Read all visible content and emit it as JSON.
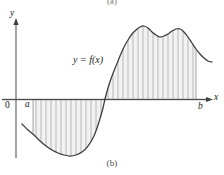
{
  "figure": {
    "panel_top_caption": "(a)",
    "panel_bottom_caption": "(b)",
    "curve_label": "y = f(x)",
    "axis": {
      "y_label": "y",
      "x_label": "x",
      "origin_label": "0",
      "lower_limit_label": "a",
      "upper_limit_label": "b"
    },
    "colors": {
      "curve": "#3b3b3b",
      "axis": "#4a4a4a",
      "hatch": "#9a9a9a",
      "fill": "#f2f2f2",
      "text": "#1a1a1a",
      "caption": "#4a4a4a"
    }
  },
  "chart_data": {
    "type": "area",
    "title": "",
    "xlabel": "x",
    "ylabel": "y",
    "grid": false,
    "legend": "none",
    "annotations": [
      {
        "text": "y = f(x)",
        "x": 0.38,
        "y": 0.62
      },
      {
        "text": "a",
        "x": 0.105,
        "y": 0.0
      },
      {
        "text": "b",
        "x": 0.905,
        "y": 0.0
      },
      {
        "text": "0",
        "x": 0.0,
        "y": 0.0
      }
    ],
    "series": [
      {
        "name": "f(x)",
        "comment": "Curve sampled in pixel space: x left-to-right, y with axis (y=0) at pixel 99.5",
        "points_px": [
          [
            22,
            124
          ],
          [
            28,
            130
          ],
          [
            34,
            135
          ],
          [
            40,
            141
          ],
          [
            46,
            146
          ],
          [
            52,
            150
          ],
          [
            58,
            153
          ],
          [
            64,
            155
          ],
          [
            70,
            156
          ],
          [
            76,
            155
          ],
          [
            82,
            152
          ],
          [
            88,
            146
          ],
          [
            94,
            136
          ],
          [
            99,
            122
          ],
          [
            103,
            108
          ],
          [
            105,
            99
          ],
          [
            108,
            88
          ],
          [
            112,
            76
          ],
          [
            116,
            66
          ],
          [
            120,
            56
          ],
          [
            124,
            47
          ],
          [
            128,
            40
          ],
          [
            132,
            34
          ],
          [
            136,
            30
          ],
          [
            140,
            27
          ],
          [
            144,
            26
          ],
          [
            148,
            28
          ],
          [
            152,
            32
          ],
          [
            156,
            35
          ],
          [
            160,
            37
          ],
          [
            164,
            36
          ],
          [
            168,
            34
          ],
          [
            172,
            31
          ],
          [
            176,
            29
          ],
          [
            180,
            29
          ],
          [
            184,
            32
          ],
          [
            188,
            37
          ],
          [
            192,
            43
          ],
          [
            196,
            49
          ],
          [
            200,
            54
          ],
          [
            204,
            58
          ],
          [
            208,
            61
          ],
          [
            212,
            62
          ]
        ],
        "zero_crossings_px": [
          105
        ],
        "extrema_px": [
          {
            "kind": "minimum",
            "x": 70,
            "y": 156
          },
          {
            "kind": "maximum",
            "x": 144,
            "y": 26
          },
          {
            "kind": "local-minimum",
            "x": 160,
            "y": 37
          },
          {
            "kind": "maximum",
            "x": 180,
            "y": 29
          }
        ]
      }
    ],
    "shaded_region": {
      "from_px": 33,
      "to_px": 196,
      "baseline_px": 99.5,
      "hatch_spacing_px": 5,
      "description": "Region between curve and x-axis from a to b, hatched vertically; negative below axis on [a, 105], positive above axis on [105, b]"
    },
    "axes_px": {
      "y_axis_x": 16,
      "y_axis_top": 20,
      "y_axis_bottom": 158,
      "x_axis_y": 99.5,
      "x_axis_left": 2,
      "x_axis_right": 212
    }
  }
}
